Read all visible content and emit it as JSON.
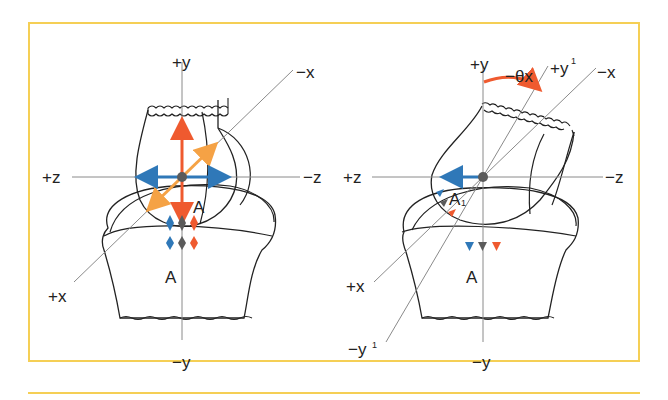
{
  "figure": {
    "panels": [
      {
        "id": "left",
        "axes": {
          "plus_y": "+y",
          "minus_y": "−y",
          "plus_z": "+z",
          "minus_z": "−z",
          "plus_x": "+x",
          "minus_x": "−x"
        },
        "point_label": "A",
        "contact_label": "A"
      },
      {
        "id": "right",
        "axes": {
          "plus_y": "+y",
          "minus_y": "−y",
          "plus_z": "+z",
          "minus_z": "−z",
          "plus_x": "+x",
          "minus_x": "−x",
          "plus_y_prime": "+y",
          "minus_y_prime": "−y",
          "prime_mark": "1"
        },
        "rotation_label": "−θx",
        "point_label": "A",
        "point_label_sub": "1",
        "contact_label": "A"
      }
    ],
    "colors": {
      "border": "#f5cf55",
      "y_arrow": "#ef5a2f",
      "x_arrow": "#f5a245",
      "z_arrow": "#2f78b8",
      "marker_blue": "#2f78b8",
      "marker_gray": "#5b5b5b",
      "marker_red": "#ef5a2f",
      "axis_line": "#8a8a8a",
      "outline": "#222222"
    }
  }
}
